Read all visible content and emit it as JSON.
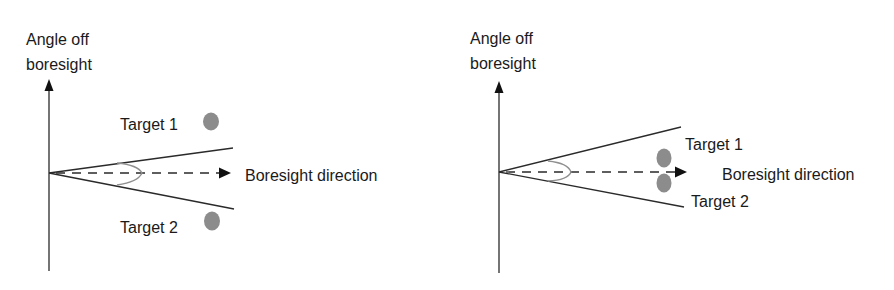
{
  "figure": {
    "panels": [
      {
        "id": "left",
        "description": "Two targets separated by more than the beamwidth — resolved",
        "axis_label_line1": "Angle off",
        "axis_label_line2": "boresight",
        "boresight_label": "Boresight direction",
        "targets": [
          {
            "label": "Target 1",
            "position": "above beam, outside"
          },
          {
            "label": "Target 2",
            "position": "below beam, outside"
          }
        ]
      },
      {
        "id": "right",
        "description": "Two targets both inside the beamwidth — unresolved",
        "axis_label_line1": "Angle off",
        "axis_label_line2": "boresight",
        "boresight_label": "Boresight direction",
        "targets": [
          {
            "label": "Target 1",
            "position": "inside beam, above boresight"
          },
          {
            "label": "Target 2",
            "position": "inside beam, below boresight"
          }
        ]
      }
    ],
    "colors": {
      "line": "#2a2a2a",
      "arc": "#8f8f8f",
      "target": "#8c8c8c",
      "text": "#1a1a1a"
    }
  }
}
